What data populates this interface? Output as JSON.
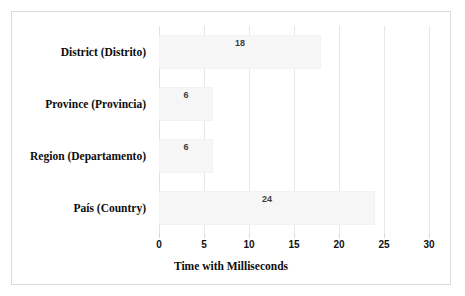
{
  "chart_data": {
    "type": "bar",
    "orientation": "horizontal",
    "title": "",
    "xlabel": "Time with Milliseconds",
    "ylabel": "",
    "categories": [
      "District (Distrito)",
      "Province (Provincia)",
      "Region (Departamento)",
      "País (Country)"
    ],
    "values": [
      18,
      6,
      6,
      24
    ],
    "data_labels": [
      "18",
      "6",
      "6",
      "24"
    ],
    "xlim": [
      0,
      30
    ],
    "xticks": [
      0,
      5,
      10,
      15,
      20,
      25,
      30
    ],
    "xtick_labels": [
      "0",
      "5",
      "10",
      "15",
      "20",
      "25",
      "30"
    ],
    "grid": "vertical",
    "legend": "none",
    "bar_color": "#f6f6f7",
    "gridline_color": "#e6e6e6",
    "text_color": "#0d0d0d",
    "border_color": "#dcdcdc"
  }
}
